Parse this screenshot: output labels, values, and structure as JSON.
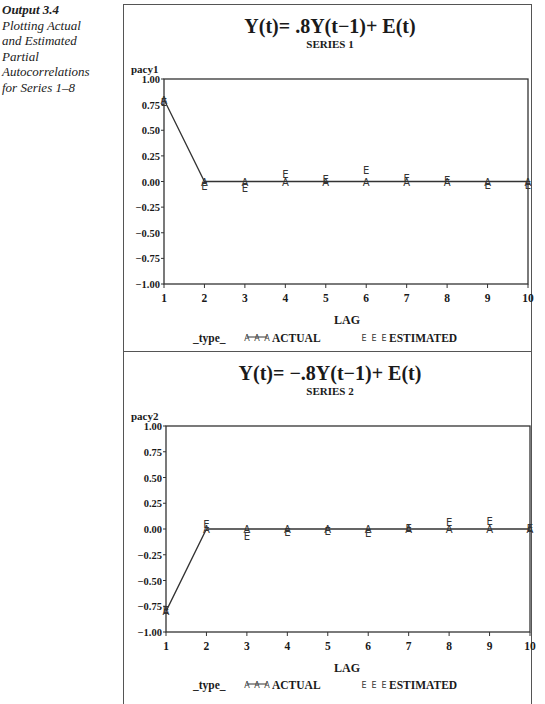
{
  "caption": {
    "label": "Output 3.4",
    "lines": [
      "Plotting Actual",
      "and Estimated",
      "Partial",
      "Autocorrelations",
      "for Series 1–8"
    ]
  },
  "legend": {
    "title": "_type_",
    "actual_symbol": "A",
    "actual_label": "ACTUAL",
    "estimated_symbol": "E",
    "estimated_label": "ESTIMATED"
  },
  "chart_data": [
    {
      "type": "scatter",
      "title": "Y(t)= .8Y(t−1)+ E(t)",
      "subtitle": "SERIES 1",
      "xlabel": "LAG",
      "ylabel": "pacy1",
      "x": [
        1,
        2,
        3,
        4,
        5,
        6,
        7,
        8,
        9,
        10
      ],
      "xticks": [
        "1",
        "2",
        "3",
        "4",
        "5",
        "6",
        "7",
        "8",
        "9",
        "10"
      ],
      "yticks": [
        "1.00",
        "0.75",
        "0.50",
        "0.25",
        "0.00",
        "−0.25",
        "−0.50",
        "−0.75",
        "−1.00"
      ],
      "ylim": [
        -1,
        1
      ],
      "grid": false,
      "legend_position": "bottom",
      "series": [
        {
          "name": "ACTUAL",
          "symbol": "A",
          "joined": true,
          "values": [
            0.8,
            0,
            0,
            0,
            0,
            0,
            0,
            0,
            0,
            0
          ]
        },
        {
          "name": "ESTIMATED",
          "symbol": "E",
          "joined": false,
          "values": [
            0.78,
            -0.04,
            -0.06,
            0.07,
            0.02,
            0.11,
            0.03,
            0.01,
            -0.03,
            -0.03
          ]
        }
      ]
    },
    {
      "type": "scatter",
      "title": "Y(t)= −.8Y(t−1)+ E(t)",
      "subtitle": "SERIES 2",
      "xlabel": "LAG",
      "ylabel": "pacy2",
      "x": [
        1,
        2,
        3,
        4,
        5,
        6,
        7,
        8,
        9,
        10
      ],
      "xticks": [
        "1",
        "2",
        "3",
        "4",
        "5",
        "6",
        "7",
        "8",
        "9",
        "10"
      ],
      "yticks": [
        "1.00",
        "0.75",
        "0.50",
        "0.25",
        "0.00",
        "−0.25",
        "−0.50",
        "−0.75",
        "−1.00"
      ],
      "ylim": [
        -1,
        1
      ],
      "grid": false,
      "legend_position": "bottom",
      "series": [
        {
          "name": "ACTUAL",
          "symbol": "A",
          "joined": true,
          "values": [
            -0.8,
            0,
            0,
            0,
            0,
            0,
            0,
            0,
            0,
            0
          ]
        },
        {
          "name": "ESTIMATED",
          "symbol": "E",
          "joined": false,
          "values": [
            -0.79,
            0.05,
            -0.07,
            -0.03,
            -0.02,
            -0.04,
            0.01,
            0.07,
            0.08,
            0.01
          ]
        }
      ]
    }
  ]
}
